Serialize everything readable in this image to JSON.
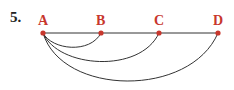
{
  "problem": {
    "number": "5."
  },
  "nodes": [
    {
      "id": "A",
      "label": "A",
      "x": 43,
      "y": 33
    },
    {
      "id": "B",
      "label": "B",
      "x": 101,
      "y": 33
    },
    {
      "id": "C",
      "label": "C",
      "x": 159,
      "y": 33
    },
    {
      "id": "D",
      "label": "D",
      "x": 218,
      "y": 33
    }
  ],
  "edges": [
    {
      "from": "A",
      "to": "D",
      "type": "straight-line",
      "via": [
        "B",
        "C"
      ]
    },
    {
      "from": "A",
      "to": "B",
      "type": "arc",
      "bottom_y": 48
    },
    {
      "from": "A",
      "to": "C",
      "type": "arc",
      "bottom_y": 63
    },
    {
      "from": "A",
      "to": "D",
      "type": "arc",
      "bottom_y": 83
    }
  ],
  "colors": {
    "node": "#c8372d",
    "label": "#c8372d",
    "edge": "#333333",
    "number": "#222222"
  }
}
